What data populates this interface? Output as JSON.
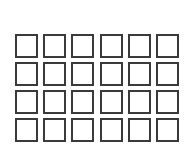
{
  "grid": {
    "rows": 4,
    "columns": 6,
    "cell_border_color": "#3a3a3a",
    "cell_fill_color": "#ffffff",
    "background_color": "#ffffff",
    "cells": [
      [
        "",
        "",
        "",
        "",
        "",
        ""
      ],
      [
        "",
        "",
        "",
        "",
        "",
        ""
      ],
      [
        "",
        "",
        "",
        "",
        "",
        ""
      ],
      [
        "",
        "",
        "",
        "",
        "",
        ""
      ]
    ]
  }
}
